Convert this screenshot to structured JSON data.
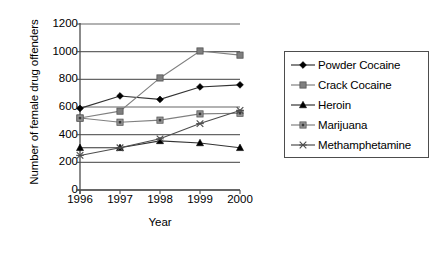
{
  "chart_data": {
    "type": "line",
    "title": "",
    "xlabel": "Year",
    "ylabel": "Number of female drug offenders",
    "categories": [
      "1996",
      "1997",
      "1998",
      "1999",
      "2000"
    ],
    "x": [
      1996,
      1997,
      1998,
      1999,
      2000
    ],
    "ylim": [
      0,
      1200
    ],
    "yticks": [
      "0",
      "200",
      "400",
      "600",
      "800",
      "1000",
      "1200"
    ],
    "ytick_values": [
      0,
      200,
      400,
      600,
      800,
      1000,
      1200
    ],
    "grid": true,
    "legend_position": "right",
    "series": [
      {
        "name": "Powder Cocaine",
        "marker": "diamond",
        "color": "#000000",
        "line_color": "#333333",
        "values": [
          590,
          680,
          655,
          745,
          760
        ]
      },
      {
        "name": "Crack Cocaine",
        "marker": "square",
        "color": "#7f7f7f",
        "line_color": "#808080",
        "values": [
          520,
          570,
          810,
          1005,
          975
        ]
      },
      {
        "name": "Heroin",
        "marker": "triangle",
        "color": "#000000",
        "line_color": "#333333",
        "values": [
          305,
          305,
          355,
          340,
          305
        ]
      },
      {
        "name": "Marijuana",
        "marker": "square-dot",
        "color": "#999999",
        "line_color": "#808080",
        "values": [
          520,
          490,
          505,
          550,
          555
        ]
      },
      {
        "name": "Methamphetamine",
        "marker": "asterisk",
        "color": "#4d4d4d",
        "line_color": "#4d4d4d",
        "values": [
          250,
          305,
          370,
          480,
          575
        ]
      }
    ]
  },
  "legend": {
    "items": [
      {
        "label": "Powder Cocaine"
      },
      {
        "label": "Crack Cocaine"
      },
      {
        "label": "Heroin"
      },
      {
        "label": "Marijuana"
      },
      {
        "label": "Methamphetamine"
      }
    ]
  },
  "colors": {
    "axis": "#4d4d4d",
    "grid": "#666666",
    "background": "#ffffff",
    "text": "#000000"
  }
}
